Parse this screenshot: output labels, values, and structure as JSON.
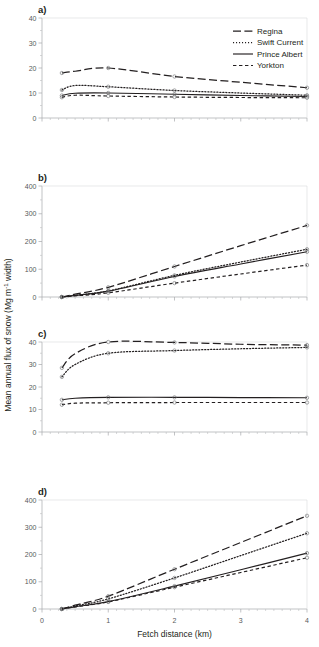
{
  "figure": {
    "axis_titles": {
      "x": "Fetch distance (km)",
      "y_main": "Mean annual flux of snow  (Mg m",
      "y_sup": "-1",
      "y_tail": " width)"
    },
    "legend": {
      "items": [
        {
          "label": "Regina",
          "style": "long-dash"
        },
        {
          "label": "Swift Current",
          "style": "dotted"
        },
        {
          "label": "Prince Albert",
          "style": "solid"
        },
        {
          "label": "Yorkton",
          "style": "short-dash"
        }
      ]
    },
    "panels": [
      {
        "letter": "a)",
        "yticks": [
          "0",
          "10",
          "20",
          "30",
          "40"
        ]
      },
      {
        "letter": "b)",
        "yticks": [
          "0",
          "100",
          "200",
          "300",
          "400"
        ]
      },
      {
        "letter": "c)",
        "yticks": [
          "0",
          "10",
          "20",
          "30",
          "40"
        ]
      },
      {
        "letter": "d)",
        "yticks": [
          "0",
          "100",
          "200",
          "300",
          "400"
        ]
      }
    ],
    "xticks": [
      "0",
      "1",
      "2",
      "3",
      "4"
    ]
  },
  "chart_data": [
    {
      "type": "line",
      "panel": "a)",
      "title": "",
      "xlabel": "Fetch distance (km)",
      "ylabel": "Mean annual flux of snow (Mg m-1 width)",
      "xlim": [
        0,
        4
      ],
      "ylim": [
        0,
        40
      ],
      "xticks": [
        0,
        1,
        2,
        3,
        4
      ],
      "yticks": [
        0,
        10,
        20,
        30,
        40
      ],
      "grid": false,
      "legend_position": "top-right",
      "x": [
        0.3,
        0.5,
        1.0,
        2.0,
        3.0,
        4.0
      ],
      "series": [
        {
          "name": "Regina",
          "values": [
            18.0,
            18.7,
            20.0,
            16.6,
            14.3,
            12.1
          ]
        },
        {
          "name": "Swift Current",
          "values": [
            11.2,
            13.0,
            12.5,
            11.0,
            10.0,
            9.1
          ]
        },
        {
          "name": "Prince Albert",
          "values": [
            9.0,
            9.9,
            10.0,
            9.5,
            9.0,
            8.6
          ]
        },
        {
          "name": "Yorkton",
          "values": [
            8.3,
            9.1,
            8.8,
            8.4,
            8.2,
            8.1
          ]
        }
      ]
    },
    {
      "type": "line",
      "panel": "b)",
      "title": "",
      "xlabel": "Fetch distance (km)",
      "ylabel": "Mean annual flux of snow (Mg m-1 width)",
      "xlim": [
        0,
        4
      ],
      "ylim": [
        0,
        400
      ],
      "xticks": [
        0,
        1,
        2,
        3,
        4
      ],
      "yticks": [
        0,
        100,
        200,
        300,
        400
      ],
      "grid": false,
      "x": [
        0.3,
        0.5,
        1.0,
        2.0,
        3.0,
        4.0
      ],
      "series": [
        {
          "name": "Regina",
          "values": [
            0,
            10,
            35,
            110,
            185,
            258
          ]
        },
        {
          "name": "Swift Current",
          "values": [
            0,
            6,
            22,
            78,
            126,
            172
          ]
        },
        {
          "name": "Prince Albert",
          "values": [
            0,
            6,
            21,
            74,
            119,
            163
          ]
        },
        {
          "name": "Yorkton",
          "values": [
            0,
            4,
            15,
            50,
            83,
            115
          ]
        }
      ]
    },
    {
      "type": "line",
      "panel": "c)",
      "title": "",
      "xlabel": "Fetch distance (km)",
      "ylabel": "Mean annual flux of snow (Mg m-1 width)",
      "xlim": [
        0,
        4
      ],
      "ylim": [
        0,
        40
      ],
      "xticks": [
        0,
        1,
        2,
        3,
        4
      ],
      "yticks": [
        0,
        10,
        20,
        30,
        40
      ],
      "grid": false,
      "x": [
        0.3,
        0.5,
        1.0,
        2.0,
        3.0,
        4.0
      ],
      "series": [
        {
          "name": "Regina",
          "values": [
            28.5,
            34.8,
            40.0,
            39.8,
            39.0,
            38.6
          ]
        },
        {
          "name": "Swift Current",
          "values": [
            24.5,
            30.0,
            35.0,
            36.2,
            37.0,
            37.6
          ]
        },
        {
          "name": "Prince Albert",
          "values": [
            14.3,
            15.0,
            15.4,
            15.4,
            15.3,
            15.2
          ]
        },
        {
          "name": "Yorkton",
          "values": [
            12.1,
            12.8,
            13.0,
            13.1,
            13.1,
            13.1
          ]
        }
      ]
    },
    {
      "type": "line",
      "panel": "d)",
      "title": "",
      "xlabel": "Fetch distance (km)",
      "ylabel": "Mean annual flux of snow (Mg m-1 width)",
      "xlim": [
        0,
        4
      ],
      "ylim": [
        0,
        400
      ],
      "xticks": [
        0,
        1,
        2,
        3,
        4
      ],
      "yticks": [
        0,
        100,
        200,
        300,
        400
      ],
      "grid": false,
      "x": [
        0.3,
        0.5,
        1.0,
        2.0,
        3.0,
        4.0
      ],
      "series": [
        {
          "name": "Regina",
          "values": [
            0,
            14,
            47,
            146,
            244,
            342
          ]
        },
        {
          "name": "Swift Current",
          "values": [
            0,
            11,
            37,
            114,
            196,
            278
          ]
        },
        {
          "name": "Prince Albert",
          "values": [
            0,
            8,
            27,
            84,
            144,
            205
          ]
        },
        {
          "name": "Yorkton",
          "values": [
            0,
            8,
            26,
            80,
            134,
            188
          ]
        }
      ]
    }
  ]
}
